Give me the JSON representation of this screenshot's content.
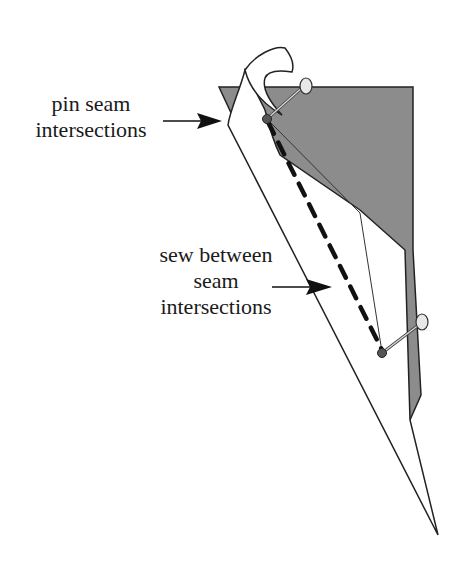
{
  "diagram": {
    "labels": {
      "pin": {
        "line1": "pin seam",
        "line2": "intersections"
      },
      "sew": {
        "line1": "sew between",
        "line2": "seam",
        "line3": "intersections"
      }
    },
    "colors": {
      "background": "#ffffff",
      "fabric_back": "#8c8c8c",
      "fabric_front": "#ffffff",
      "outline": "#222222",
      "stitch": "#111111",
      "pin_dot": "#555555",
      "pin_head": "#e8e8e8"
    }
  }
}
